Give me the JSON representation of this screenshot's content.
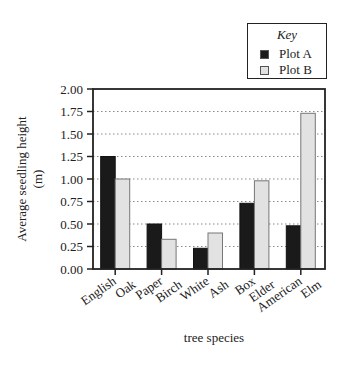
{
  "chart_data": {
    "type": "bar",
    "title": "",
    "xlabel": "tree species",
    "ylabel": "Average seedling height (m)",
    "ylabel_lines": [
      "Average seedling height",
      "(m)"
    ],
    "ylim": [
      0,
      2.0
    ],
    "yticks": [
      "0.00",
      "0.25",
      "0.50",
      "0.75",
      "1.00",
      "1.25",
      "1.50",
      "1.75",
      "2.00"
    ],
    "grid": "dotted horizontal",
    "legend": {
      "title": "Key",
      "position": "top-right",
      "entries": [
        "Plot A",
        "Plot B"
      ]
    },
    "categories": [
      "English Oak",
      "Paper Birch",
      "White Ash",
      "Box Elder",
      "American Elm"
    ],
    "category_lines": [
      [
        "English",
        "Oak"
      ],
      [
        "Paper",
        "Birch"
      ],
      [
        "White",
        "Ash"
      ],
      [
        "Box",
        "Elder"
      ],
      [
        "American",
        "Elm"
      ]
    ],
    "series": [
      {
        "name": "Plot A",
        "color": "#1a1a1a",
        "values": [
          1.25,
          0.5,
          0.23,
          0.73,
          0.48
        ]
      },
      {
        "name": "Plot B",
        "color": "#e2e2e2",
        "values": [
          1.0,
          0.33,
          0.4,
          0.98,
          1.73
        ]
      }
    ]
  }
}
